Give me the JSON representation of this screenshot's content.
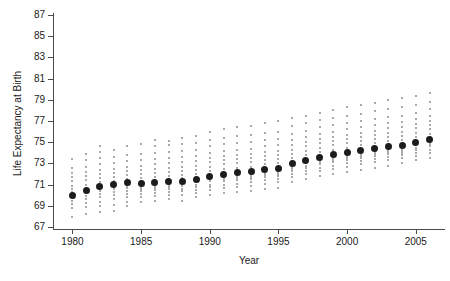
{
  "chart_data": {
    "type": "scatter",
    "title": "",
    "xlabel": "Year",
    "ylabel": "Life Expectancy at Birth",
    "xlim": [
      1979.2,
      2006.8
    ],
    "ylim": [
      67,
      87
    ],
    "xticks": [
      1980,
      1985,
      1990,
      1995,
      2000,
      2005
    ],
    "yticks": [
      67,
      69,
      71,
      73,
      75,
      77,
      79,
      81,
      83,
      85,
      87
    ],
    "grid": false,
    "legend": null,
    "marker_colors": {
      "observation": "#8e8e8e",
      "mean": "#1c1c1c",
      "axis": "#4a4a4a"
    },
    "series": [
      {
        "name": "Mean life expectancy",
        "marker": "large-black-dot",
        "x": [
          1980,
          1981,
          1982,
          1983,
          1984,
          1985,
          1986,
          1987,
          1988,
          1989,
          1990,
          1991,
          1992,
          1993,
          1994,
          1995,
          1996,
          1997,
          1998,
          1999,
          2000,
          2001,
          2002,
          2003,
          2004,
          2005,
          2006
        ],
        "values": [
          70.0,
          70.4,
          70.8,
          71.0,
          71.2,
          71.1,
          71.2,
          71.3,
          71.3,
          71.5,
          71.8,
          72.0,
          72.1,
          72.2,
          72.4,
          72.5,
          73.0,
          73.3,
          73.6,
          73.8,
          74.0,
          74.2,
          74.4,
          74.6,
          74.7,
          75.0,
          75.3
        ]
      },
      {
        "name": "Individual observations",
        "marker": "small-gray-dot",
        "x": [
          1980,
          1981,
          1982,
          1983,
          1984,
          1985,
          1986,
          1987,
          1988,
          1989,
          1990,
          1991,
          1992,
          1993,
          1994,
          1995,
          1996,
          1997,
          1998,
          1999,
          2000,
          2001,
          2002,
          2003,
          2004,
          2005,
          2006
        ],
        "spreads": [
          {
            "year": 1980,
            "min": 67.9,
            "max": 73.4,
            "points": [
              67.9,
              68.8,
              69.2,
              69.5,
              69.8,
              70.0,
              70.3,
              70.6,
              70.9,
              71.3,
              71.7,
              72.1,
              72.6,
              73.4
            ]
          },
          {
            "year": 1981,
            "min": 68.2,
            "max": 73.9,
            "points": [
              68.2,
              68.9,
              69.3,
              69.6,
              69.9,
              70.2,
              70.4,
              70.7,
              71.0,
              71.4,
              71.8,
              72.2,
              72.7,
              73.3,
              73.9
            ]
          },
          {
            "year": 1982,
            "min": 68.4,
            "max": 74.6,
            "points": [
              68.4,
              69.0,
              69.4,
              69.8,
              70.1,
              70.4,
              70.7,
              70.9,
              71.2,
              71.6,
              72.0,
              72.4,
              72.9,
              73.5,
              74.1,
              74.6
            ]
          },
          {
            "year": 1983,
            "min": 68.5,
            "max": 74.3,
            "points": [
              68.5,
              69.1,
              69.6,
              70.0,
              70.3,
              70.6,
              70.8,
              71.0,
              71.3,
              71.7,
              72.1,
              72.5,
              73.0,
              73.6,
              74.3
            ]
          },
          {
            "year": 1984,
            "min": 69.0,
            "max": 74.6,
            "points": [
              69.0,
              69.4,
              69.8,
              70.1,
              70.4,
              70.7,
              70.9,
              71.1,
              71.2,
              71.5,
              71.9,
              72.3,
              72.7,
              73.2,
              73.8,
              74.6
            ]
          },
          {
            "year": 1985,
            "min": 69.4,
            "max": 74.8,
            "points": [
              69.4,
              69.8,
              70.1,
              70.4,
              70.6,
              70.8,
              71.0,
              71.1,
              71.3,
              71.6,
              72.0,
              72.4,
              72.8,
              73.3,
              73.9,
              74.8
            ]
          },
          {
            "year": 1986,
            "min": 69.5,
            "max": 75.2,
            "points": [
              69.5,
              69.9,
              70.2,
              70.5,
              70.7,
              70.9,
              71.1,
              71.2,
              71.4,
              71.7,
              72.1,
              72.5,
              72.9,
              73.4,
              74.0,
              74.6,
              75.2
            ]
          },
          {
            "year": 1987,
            "min": 69.6,
            "max": 75.1,
            "points": [
              69.6,
              70.0,
              70.3,
              70.6,
              70.8,
              71.0,
              71.2,
              71.3,
              71.5,
              71.8,
              72.2,
              72.6,
              73.0,
              73.5,
              74.1,
              74.7,
              75.1
            ]
          },
          {
            "year": 1988,
            "min": 69.5,
            "max": 75.4,
            "points": [
              69.5,
              70.0,
              70.4,
              70.6,
              70.9,
              71.1,
              71.2,
              71.4,
              71.6,
              71.9,
              72.3,
              72.7,
              73.1,
              73.6,
              74.2,
              74.8,
              75.4
            ]
          },
          {
            "year": 1989,
            "min": 69.8,
            "max": 75.6,
            "points": [
              69.8,
              70.2,
              70.5,
              70.8,
              71.0,
              71.2,
              71.4,
              71.5,
              71.7,
              72.0,
              72.4,
              72.8,
              73.2,
              73.7,
              74.3,
              74.9,
              75.6
            ]
          },
          {
            "year": 1990,
            "min": 70.0,
            "max": 76.0,
            "points": [
              70.0,
              70.5,
              70.8,
              71.0,
              71.3,
              71.5,
              71.6,
              71.8,
              72.0,
              72.3,
              72.7,
              73.1,
              73.5,
              74.0,
              74.6,
              75.2,
              76.0
            ]
          },
          {
            "year": 1991,
            "min": 70.2,
            "max": 76.2,
            "points": [
              70.2,
              70.7,
              71.0,
              71.3,
              71.5,
              71.7,
              71.9,
              72.0,
              72.2,
              72.5,
              72.9,
              73.3,
              73.7,
              74.2,
              74.8,
              75.4,
              76.2
            ]
          },
          {
            "year": 1992,
            "min": 70.3,
            "max": 76.4,
            "points": [
              70.3,
              70.8,
              71.1,
              71.4,
              71.6,
              71.8,
              72.0,
              72.1,
              72.3,
              72.6,
              73.0,
              73.4,
              73.8,
              74.3,
              74.9,
              75.6,
              76.4
            ]
          },
          {
            "year": 1993,
            "min": 70.4,
            "max": 76.5,
            "points": [
              70.4,
              70.9,
              71.2,
              71.5,
              71.7,
              71.9,
              72.1,
              72.2,
              72.4,
              72.7,
              73.1,
              73.5,
              73.9,
              74.4,
              75.0,
              75.7,
              76.5
            ]
          },
          {
            "year": 1994,
            "min": 70.6,
            "max": 76.8,
            "points": [
              70.6,
              71.1,
              71.4,
              71.7,
              71.9,
              72.1,
              72.3,
              72.4,
              72.6,
              72.9,
              73.3,
              73.7,
              74.1,
              74.6,
              75.2,
              75.9,
              76.8
            ]
          },
          {
            "year": 1995,
            "min": 70.7,
            "max": 77.0,
            "points": [
              70.7,
              71.2,
              71.5,
              71.8,
              72.0,
              72.2,
              72.4,
              72.5,
              72.7,
              73.0,
              73.4,
              73.8,
              74.2,
              74.7,
              75.3,
              76.0,
              77.0
            ]
          },
          {
            "year": 1996,
            "min": 71.2,
            "max": 77.3,
            "points": [
              71.2,
              71.7,
              72.0,
              72.3,
              72.5,
              72.7,
              72.9,
              73.0,
              73.2,
              73.5,
              73.9,
              74.3,
              74.7,
              75.2,
              75.8,
              76.5,
              77.3
            ]
          },
          {
            "year": 1997,
            "min": 71.5,
            "max": 77.5,
            "points": [
              71.5,
              72.0,
              72.3,
              72.6,
              72.8,
              73.0,
              73.2,
              73.3,
              73.5,
              73.8,
              74.2,
              74.6,
              75.0,
              75.5,
              76.1,
              76.8,
              77.5
            ]
          },
          {
            "year": 1998,
            "min": 71.8,
            "max": 77.8,
            "points": [
              71.8,
              72.3,
              72.6,
              72.9,
              73.1,
              73.3,
              73.5,
              73.6,
              73.8,
              74.1,
              74.5,
              74.9,
              75.3,
              75.8,
              76.4,
              77.1,
              77.8
            ]
          },
          {
            "year": 1999,
            "min": 72.0,
            "max": 78.0,
            "points": [
              72.0,
              72.5,
              72.8,
              73.1,
              73.3,
              73.5,
              73.7,
              73.8,
              74.0,
              74.3,
              74.7,
              75.1,
              75.5,
              76.0,
              76.6,
              77.3,
              78.0
            ]
          },
          {
            "year": 2000,
            "min": 72.2,
            "max": 78.3,
            "points": [
              72.2,
              72.7,
              73.0,
              73.3,
              73.5,
              73.7,
              73.9,
              74.0,
              74.2,
              74.5,
              74.9,
              75.3,
              75.7,
              76.2,
              76.8,
              77.5,
              78.3
            ]
          },
          {
            "year": 2001,
            "min": 72.4,
            "max": 78.5,
            "points": [
              72.4,
              72.9,
              73.2,
              73.5,
              73.7,
              73.9,
              74.1,
              74.2,
              74.4,
              74.7,
              75.1,
              75.5,
              75.9,
              76.4,
              77.0,
              77.7,
              78.5
            ]
          },
          {
            "year": 2002,
            "min": 72.6,
            "max": 78.7,
            "points": [
              72.6,
              73.1,
              73.4,
              73.7,
              73.9,
              74.1,
              74.3,
              74.4,
              74.6,
              74.9,
              75.3,
              75.7,
              76.1,
              76.6,
              77.2,
              77.9,
              78.7
            ]
          },
          {
            "year": 2003,
            "min": 72.8,
            "max": 79.0,
            "points": [
              72.8,
              73.3,
              73.6,
              73.9,
              74.1,
              74.3,
              74.5,
              74.6,
              74.8,
              75.1,
              75.5,
              75.9,
              76.3,
              76.8,
              77.4,
              78.1,
              79.0
            ]
          },
          {
            "year": 2004,
            "min": 73.0,
            "max": 79.2,
            "points": [
              73.0,
              73.5,
              73.8,
              74.0,
              74.2,
              74.4,
              74.6,
              74.7,
              74.9,
              75.2,
              75.6,
              76.0,
              76.4,
              76.9,
              77.5,
              78.3,
              79.2
            ]
          },
          {
            "year": 2005,
            "min": 73.3,
            "max": 79.4,
            "points": [
              73.3,
              73.7,
              74.0,
              74.3,
              74.5,
              74.7,
              74.9,
              75.0,
              75.2,
              75.5,
              75.9,
              76.3,
              76.7,
              77.2,
              77.8,
              78.5,
              79.4
            ]
          },
          {
            "year": 2006,
            "min": 73.5,
            "max": 79.6,
            "points": [
              73.5,
              74.0,
              74.3,
              74.6,
              74.8,
              75.0,
              75.2,
              75.3,
              75.5,
              75.8,
              76.2,
              76.6,
              77.0,
              77.5,
              78.1,
              78.8,
              79.6
            ]
          }
        ]
      }
    ]
  }
}
